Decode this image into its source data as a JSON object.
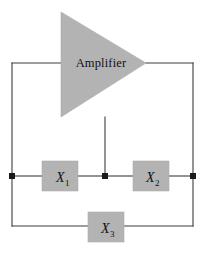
{
  "figure": {
    "background_color": "#ffffff",
    "wire_color": "#3d3d3d",
    "shape_fill": "#b3b3b3",
    "shape_stroke": "#a0a0a0",
    "label_color": "#111111"
  },
  "amplifier": {
    "label": "Amplifier",
    "shape": "triangle",
    "fill": "#b3b3b3"
  },
  "components": [
    {
      "id": "x1",
      "label": "X",
      "subscript": "1",
      "shape": "rect",
      "fill": "#b3b3b3"
    },
    {
      "id": "x2",
      "label": "X",
      "subscript": "2",
      "shape": "rect",
      "fill": "#b3b3b3"
    },
    {
      "id": "x3",
      "label": "X",
      "subscript": "3",
      "shape": "rect",
      "fill": "#b3b3b3"
    }
  ],
  "nodes": [
    {
      "id": "node-left",
      "type": "junction-dot"
    },
    {
      "id": "node-middle",
      "type": "junction-dot"
    },
    {
      "id": "node-right",
      "type": "junction-dot"
    }
  ]
}
